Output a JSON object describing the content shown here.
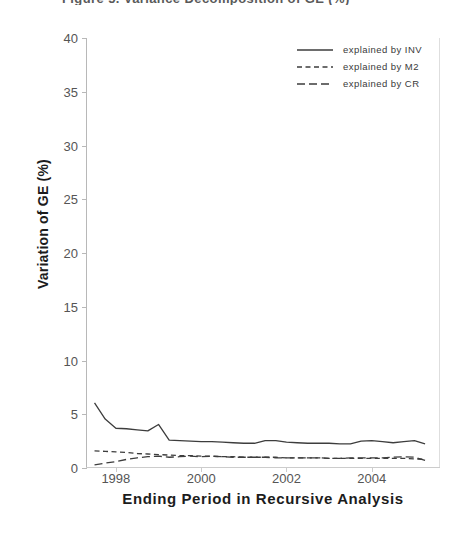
{
  "figure": {
    "title_remnant": "Figure 5. Variance Decomposition of GE (%)"
  },
  "chart_data": {
    "type": "line",
    "title": "",
    "xlabel": "Ending Period in Recursive Analysis",
    "ylabel": "Variation of GE (%)",
    "xlim": [
      1997.3,
      2005.6
    ],
    "ylim": [
      0,
      40
    ],
    "yticks": [
      0,
      5,
      10,
      15,
      20,
      25,
      30,
      35,
      40
    ],
    "ytick_labels": [
      "0",
      "5",
      "10",
      "15",
      "20",
      "25",
      "30",
      "35",
      "40"
    ],
    "xticks": [
      1998,
      2000,
      2002,
      2004
    ],
    "xtick_labels": [
      "1998",
      "2000",
      "2002",
      "2004"
    ],
    "grid": false,
    "legend_position": "top-right",
    "x": [
      1997.5,
      1997.75,
      1998.0,
      1998.25,
      1998.5,
      1998.75,
      1999.0,
      1999.25,
      1999.5,
      1999.75,
      2000.0,
      2000.25,
      2000.5,
      2000.75,
      2001.0,
      2001.25,
      2001.5,
      2001.75,
      2002.0,
      2002.25,
      2002.5,
      2002.75,
      2003.0,
      2003.25,
      2003.5,
      2003.75,
      2004.0,
      2004.25,
      2004.5,
      2004.75,
      2005.0,
      2005.25
    ],
    "series": [
      {
        "name": "explained by INV",
        "style": "solid",
        "color": "#3d3d3d",
        "values": [
          6.05,
          4.55,
          3.7,
          3.65,
          3.55,
          3.45,
          4.05,
          2.6,
          2.55,
          2.5,
          2.45,
          2.45,
          2.4,
          2.35,
          2.3,
          2.3,
          2.55,
          2.55,
          2.4,
          2.35,
          2.3,
          2.3,
          2.3,
          2.25,
          2.25,
          2.5,
          2.55,
          2.45,
          2.35,
          2.45,
          2.55,
          2.25
        ]
      },
      {
        "name": "explained by M2",
        "style": "dotted",
        "color": "#3d3d3d",
        "values": [
          1.6,
          1.55,
          1.5,
          1.45,
          1.35,
          1.3,
          1.25,
          1.2,
          1.15,
          1.15,
          1.1,
          1.1,
          1.05,
          1.05,
          1.0,
          1.0,
          1.0,
          1.0,
          0.95,
          0.95,
          0.95,
          0.95,
          0.9,
          0.9,
          0.9,
          0.9,
          0.9,
          0.9,
          0.9,
          0.9,
          0.85,
          0.8
        ]
      },
      {
        "name": "explained by CR",
        "style": "dashed",
        "color": "#3d3d3d",
        "values": [
          0.3,
          0.45,
          0.6,
          0.8,
          0.95,
          1.05,
          1.1,
          1.0,
          1.05,
          1.1,
          1.05,
          1.1,
          1.05,
          1.0,
          1.0,
          1.0,
          1.0,
          0.95,
          0.95,
          0.95,
          0.95,
          0.95,
          0.9,
          0.9,
          0.95,
          0.95,
          0.95,
          0.95,
          1.0,
          1.05,
          1.0,
          0.7
        ]
      }
    ]
  }
}
